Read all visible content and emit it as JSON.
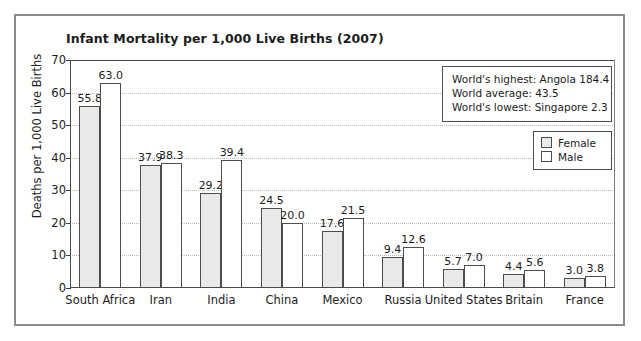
{
  "chart_data": {
    "type": "bar",
    "title": "Infant Mortality per 1,000 Live Births (2007)",
    "xlabel": "",
    "ylabel": "Deaths per 1,000 Live Births",
    "ylim": [
      0,
      70
    ],
    "ytick_step": 10,
    "yticks": [
      "0",
      "10",
      "20",
      "30",
      "40",
      "50",
      "60",
      "70"
    ],
    "grid": true,
    "grid_orientation": "horizontal",
    "legend_position": "top-right",
    "categories": [
      "South Africa",
      "Iran",
      "India",
      "China",
      "Mexico",
      "Russia",
      "United States",
      "Britain",
      "France"
    ],
    "series": [
      {
        "name": "Female",
        "color": "#e9e9e9",
        "values": [
          55.8,
          37.9,
          29.2,
          24.5,
          17.6,
          9.4,
          5.7,
          4.4,
          3.0
        ],
        "labels": [
          "55.8",
          "37.9",
          "29.2",
          "24.5",
          "17.6",
          "9.4",
          "5.7",
          "4.4",
          "3.0"
        ]
      },
      {
        "name": "Male",
        "color": "#ffffff",
        "values": [
          63.0,
          38.3,
          39.4,
          20.0,
          21.5,
          12.6,
          7.0,
          5.6,
          3.8
        ],
        "labels": [
          "63.0",
          "38.3",
          "39.4",
          "20.0",
          "21.5",
          "12.6",
          "7.0",
          "5.6",
          "3.8"
        ]
      }
    ],
    "annotations": [
      "World's highest: Angola 184.4",
      "World average: 43.5",
      "World's lowest: Singapore 2.3"
    ]
  }
}
